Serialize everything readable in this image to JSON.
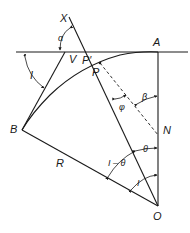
{
  "diagram": {
    "points": {
      "X": "X",
      "A": "A",
      "V": "V",
      "P_prime": "P′",
      "P": "P",
      "B": "B",
      "N": "N",
      "O": "O"
    },
    "segments": {
      "R": "R"
    },
    "angles": {
      "alpha": "α",
      "beta": "β",
      "phi": "φ",
      "theta": "θ",
      "I_left": "I",
      "I_minus_theta": "I – θ",
      "I_bottom": "I"
    }
  }
}
